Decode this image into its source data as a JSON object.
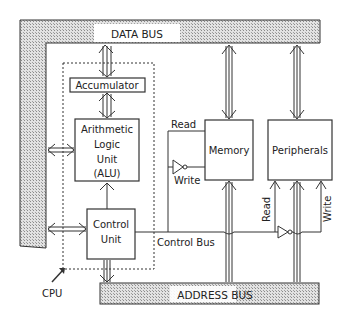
{
  "diagram": {
    "buses": {
      "data_bus": "DATA BUS",
      "address_bus": "ADDRESS BUS",
      "control_bus": "Control Bus"
    },
    "cpu": {
      "label": "CPU",
      "accumulator": "Accumulator",
      "alu": {
        "line1": "Arithmetic",
        "line2": "Logic",
        "line3": "Unit",
        "line4": "(ALU)"
      },
      "control_unit": {
        "line1": "Control",
        "line2": "Unit"
      }
    },
    "memory": {
      "label": "Memory",
      "read": "Read",
      "write": "Write"
    },
    "peripherals": {
      "label": "Peripherals",
      "read": "Read",
      "write": "Write"
    },
    "colors": {
      "bus_fill": "#bdbdbd",
      "line": "#222222",
      "background": "#ffffff"
    }
  }
}
